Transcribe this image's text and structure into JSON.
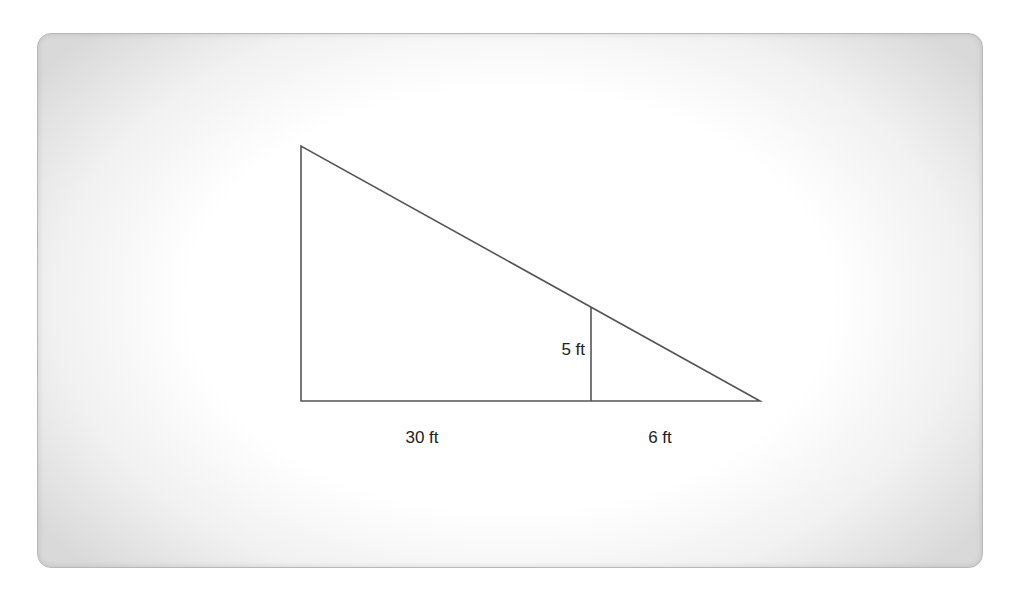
{
  "diagram": {
    "type": "similar-right-triangles",
    "labels": {
      "inner_height": "5 ft",
      "left_base": "30 ft",
      "right_base": "6 ft"
    },
    "colors": {
      "line": "#555555",
      "text": "#222222",
      "background": "#ffffff"
    }
  }
}
